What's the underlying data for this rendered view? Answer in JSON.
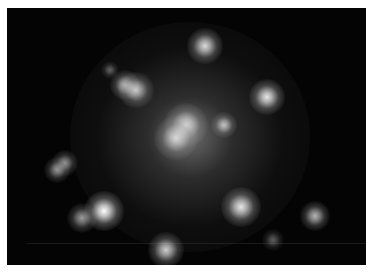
{
  "image": {
    "subject": "galaxy cluster astronomical image",
    "background_color": "#040404",
    "border_color": "#ffffff",
    "central_halo": {
      "cx": 183,
      "cy": 132,
      "r": 110
    },
    "sources": [
      {
        "cx": 205,
        "cy": 46,
        "r": 8,
        "brightness": 0.85
      },
      {
        "cx": 110,
        "cy": 70,
        "r": 4,
        "brightness": 0.35
      },
      {
        "cx": 125,
        "cy": 85,
        "r": 7,
        "brightness": 0.7
      },
      {
        "cx": 136,
        "cy": 90,
        "r": 8,
        "brightness": 0.75
      },
      {
        "cx": 267,
        "cy": 97,
        "r": 8,
        "brightness": 0.9
      },
      {
        "cx": 186,
        "cy": 125,
        "r": 10,
        "brightness": 0.8
      },
      {
        "cx": 176,
        "cy": 138,
        "r": 10,
        "brightness": 0.75
      },
      {
        "cx": 224,
        "cy": 125,
        "r": 6,
        "brightness": 0.7
      },
      {
        "cx": 65,
        "cy": 163,
        "r": 6,
        "brightness": 0.55
      },
      {
        "cx": 57,
        "cy": 170,
        "r": 6,
        "brightness": 0.55
      },
      {
        "cx": 104,
        "cy": 211,
        "r": 9,
        "brightness": 1.0
      },
      {
        "cx": 82,
        "cy": 218,
        "r": 7,
        "brightness": 0.6
      },
      {
        "cx": 241,
        "cy": 207,
        "r": 9,
        "brightness": 0.9
      },
      {
        "cx": 315,
        "cy": 216,
        "r": 7,
        "brightness": 0.7
      },
      {
        "cx": 166,
        "cy": 250,
        "r": 8,
        "brightness": 0.8
      },
      {
        "cx": 273,
        "cy": 240,
        "r": 5,
        "brightness": 0.35
      }
    ],
    "artifact_line_y": 243
  }
}
